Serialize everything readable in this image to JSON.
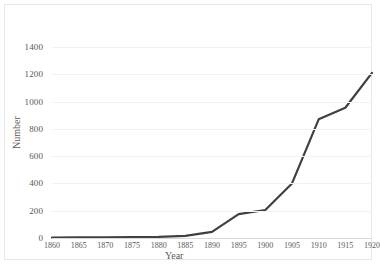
{
  "chart_data": {
    "type": "line",
    "title": "",
    "xlabel": "Year",
    "ylabel": "Number",
    "xlim": [
      1860,
      1920
    ],
    "ylim": [
      0,
      1400
    ],
    "grid": true,
    "legend": false,
    "x_ticks": [
      "1860",
      "1865",
      "1870",
      "1875",
      "1880",
      "1885",
      "1890",
      "1895",
      "1900",
      "1905",
      "1910",
      "1915",
      "1920"
    ],
    "y_ticks": [
      "0",
      "200",
      "400",
      "600",
      "800",
      "1000",
      "1200",
      "1400"
    ],
    "x": [
      1860,
      1865,
      1870,
      1875,
      1880,
      1885,
      1890,
      1895,
      1900,
      1905,
      1910,
      1915,
      1920
    ],
    "series": [
      {
        "name": "Number",
        "color": "#404040",
        "values": [
          3,
          4,
          5,
          6,
          8,
          15,
          45,
          175,
          205,
          400,
          870,
          955,
          1210
        ]
      }
    ]
  },
  "axes": {
    "x_title": "Year",
    "y_title": "Number"
  },
  "colors": {
    "line": "#404040",
    "gridline": "#f2f2f2",
    "axis": "#d9d9d9",
    "border": "#e8e8e8",
    "text": "#595959",
    "background": "#ffffff"
  }
}
